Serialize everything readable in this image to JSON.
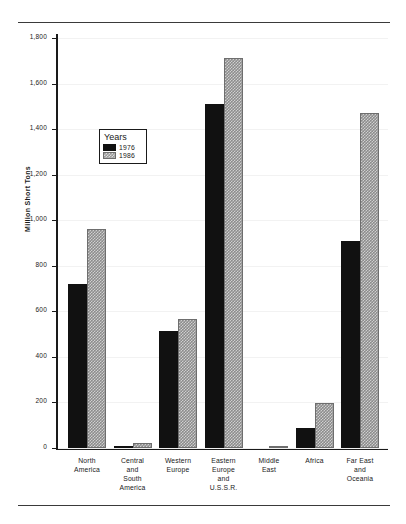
{
  "chart_data": {
    "type": "bar",
    "title": "",
    "xlabel": "",
    "ylabel": "Million Short Tons",
    "ylim": [
      0,
      1800
    ],
    "yticks": [
      0,
      200,
      400,
      600,
      800,
      1000,
      1200,
      1400,
      1600,
      1800
    ],
    "ytick_labels": [
      "0",
      "200",
      "400",
      "600",
      "800",
      "1,000",
      "1,200",
      "1,400",
      "1,600",
      "1,800"
    ],
    "grid": true,
    "legend": {
      "title": "Years",
      "position": "upper-left-inset",
      "entries": [
        {
          "name": "1976",
          "swatch": "black"
        },
        {
          "name": "1986",
          "swatch": "stippled-gray"
        }
      ]
    },
    "categories": [
      "North America",
      "Central and South America",
      "Western Europe",
      "Eastern Europe and U.S.S.R.",
      "Middle East",
      "Africa",
      "Far East and Oceania"
    ],
    "category_label_lines": [
      [
        "North",
        "America"
      ],
      [
        "Central",
        "and",
        "South",
        "America"
      ],
      [
        "Western",
        "Europe"
      ],
      [
        "Eastern",
        "Europe",
        "and",
        "U.S.S.R."
      ],
      [
        "Middle",
        "East"
      ],
      [
        "Africa"
      ],
      [
        "Far East",
        "and",
        "Oceania"
      ]
    ],
    "series": [
      {
        "name": "1976",
        "values": [
          718,
          8,
          514,
          1512,
          2,
          88,
          908
        ]
      },
      {
        "name": "1986",
        "values": [
          962,
          22,
          566,
          1712,
          3,
          198,
          1470
        ]
      }
    ]
  },
  "colors": {
    "series_1976": "#111111",
    "series_1986": "#9a9a9a",
    "axis": "#1a1a1a",
    "grid": "#f2f2f2",
    "background": "#ffffff"
  }
}
